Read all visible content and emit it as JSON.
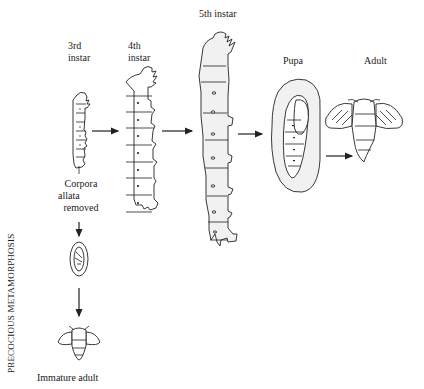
{
  "diagram": {
    "side_label": "PRECOCIOUS METAMORPHOSIS",
    "stages": [
      {
        "id": "3rd-instar",
        "label_line1": "3rd",
        "label_line2": "instar"
      },
      {
        "id": "4th-instar",
        "label_line1": "4th",
        "label_line2": "instar"
      },
      {
        "id": "5th-instar",
        "label": "5th instar"
      },
      {
        "id": "pupa",
        "label": "Pupa"
      },
      {
        "id": "adult",
        "label": "Adult"
      }
    ],
    "intervention": {
      "line1": "Corpora",
      "line2": "allata",
      "line3": "removed"
    },
    "precocious_path": {
      "final_label": "Immature adult"
    },
    "arrows": [
      {
        "from": "3rd-instar",
        "to": "4th-instar"
      },
      {
        "from": "4th-instar",
        "to": "5th-instar"
      },
      {
        "from": "5th-instar",
        "to": "pupa"
      },
      {
        "from": "pupa",
        "to": "adult"
      },
      {
        "from": "corpora-allata-removed",
        "to": "precocious-pupa"
      },
      {
        "from": "precocious-pupa",
        "to": "immature-adult"
      }
    ]
  }
}
